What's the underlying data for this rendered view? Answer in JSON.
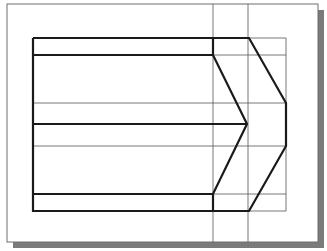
{
  "diagram": {
    "type": "technical-drawing",
    "colors": {
      "background": "#ffffff",
      "frame": "#6e6e6e",
      "shadow": "#7a7a7a",
      "thick_line": "#1a1a1a",
      "thin_line": "#555555"
    },
    "frame": {
      "x": 7,
      "y": 4,
      "width": 311,
      "height": 238
    },
    "shadow": {
      "offset": 6
    },
    "horizontal_levels": [
      38,
      55,
      103,
      124,
      146,
      194,
      211
    ],
    "vertical_levels": [
      33,
      213,
      248,
      286
    ],
    "construction_verticals_extent": {
      "top": 4,
      "bottom": 242
    }
  }
}
